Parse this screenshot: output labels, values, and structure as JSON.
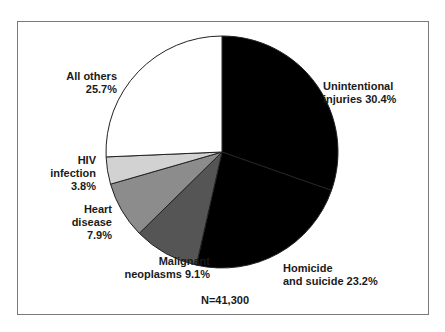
{
  "chart_data": {
    "type": "pie",
    "title": "",
    "note": "N=41,300",
    "slices": [
      {
        "label": "Unintentional injuries",
        "value": 30.4,
        "color": "#000000"
      },
      {
        "label": "Homicide and suicide",
        "value": 23.2,
        "color": "#000000"
      },
      {
        "label": "Malignant neoplasms",
        "value": 9.1,
        "color": "#555555"
      },
      {
        "label": "Heart disease",
        "value": 7.9,
        "color": "#8c8c8c"
      },
      {
        "label": "HIV infection",
        "value": 3.8,
        "color": "#d2d2d2"
      },
      {
        "label": "All others",
        "value": 25.7,
        "color": "#ffffff"
      }
    ]
  },
  "labels": {
    "unintentional": "Unintentional\ninjuries 30.4%",
    "homicide": "Homicide\nand suicide 23.2%",
    "malignant": "Malignant\nneoplasms 9.1%",
    "heart": "Heart\ndisease\n7.9%",
    "hiv": "HIV\ninfection\n3.8%",
    "others": "All others\n25.7%",
    "n": "N=41,300"
  }
}
